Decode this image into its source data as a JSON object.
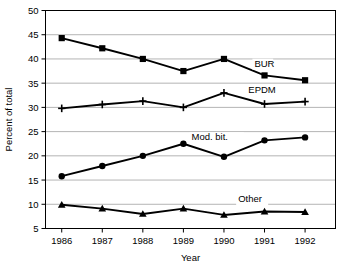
{
  "chart_data": {
    "type": "line",
    "title": "",
    "xlabel": "Year",
    "ylabel": "Percent of total",
    "categories": [
      "1986",
      "1987",
      "1988",
      "1989",
      "1990",
      "1991",
      "1992"
    ],
    "x": [
      1986,
      1987,
      1988,
      1989,
      1990,
      1991,
      1992
    ],
    "xlim": [
      1985.6,
      1992.75
    ],
    "ylim": [
      5,
      50
    ],
    "ytick_labels": [
      "5",
      "10",
      "15",
      "20",
      "25",
      "30",
      "35",
      "40",
      "45",
      "50"
    ],
    "ytick_values": [
      5,
      10,
      15,
      20,
      25,
      30,
      35,
      40,
      45,
      50
    ],
    "grid": "horizontal",
    "legend_position": "inline-right",
    "series": [
      {
        "name": "BUR",
        "marker": "square",
        "values": [
          44.3,
          42.2,
          40.0,
          37.5,
          40.0,
          36.6,
          35.6
        ],
        "label_text": "BUR",
        "label_x": 1990.75,
        "label_y": 38.4
      },
      {
        "name": "EPDM",
        "marker": "plus",
        "values": [
          29.8,
          30.6,
          31.3,
          30.0,
          33.0,
          30.7,
          31.2
        ],
        "label_text": "EPDM",
        "label_x": 1990.6,
        "label_y": 33.0
      },
      {
        "name": "Mod. bit.",
        "marker": "circle",
        "values": [
          15.8,
          17.9,
          20.0,
          22.5,
          19.8,
          23.2,
          23.8
        ],
        "label_text": "Mod. bit.",
        "label_x": 1989.2,
        "label_y": 23.2
      },
      {
        "name": "Other",
        "marker": "triangle",
        "values": [
          9.9,
          9.1,
          8.0,
          9.1,
          7.8,
          8.5,
          8.4
        ],
        "label_text": "Other",
        "label_x": 1990.35,
        "label_y": 10.4
      }
    ],
    "colors": {
      "line": "#000000",
      "marker": "#000000",
      "grid": "#b4b4b4",
      "frame": "#000000",
      "background": "#ffffff"
    }
  }
}
